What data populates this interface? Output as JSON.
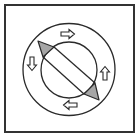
{
  "diagram": {
    "colors": {
      "stroke": "#2a2a2a",
      "frame": "#333333",
      "triangle_fill": "#a6a6a6",
      "background": "#ffffff"
    },
    "outer_circle": {
      "cx": 69,
      "cy": 69.5,
      "r": 46
    },
    "inner_circle": {
      "cx": 69,
      "cy": 70,
      "r": 28
    },
    "arrows": [
      {
        "id": "top",
        "direction": "right",
        "symbol": "⇨"
      },
      {
        "id": "right",
        "direction": "up",
        "symbol": "⇧"
      },
      {
        "id": "bottom",
        "direction": "left",
        "symbol": "⇦"
      },
      {
        "id": "left",
        "direction": "down",
        "symbol": "⇩"
      }
    ],
    "indicator": {
      "description": "Diagonal pointer bar with triangular tips",
      "tip_top_left": [
        38,
        41
      ],
      "tip_bottom_right": [
        99,
        100
      ]
    }
  }
}
